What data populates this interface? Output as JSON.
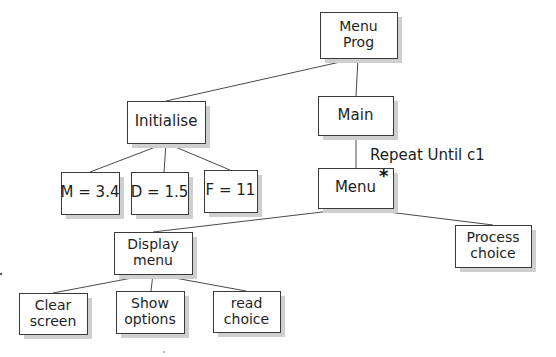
{
  "diagram": {
    "type": "structure-chart",
    "nodes": {
      "menu_prog": {
        "lines": [
          "Menu",
          "Prog"
        ],
        "x": 320,
        "y": 12,
        "w": 77,
        "h": 46
      },
      "initialise": {
        "lines": [
          "Initialise"
        ],
        "x": 127,
        "y": 101,
        "w": 78,
        "h": 42
      },
      "main": {
        "lines": [
          "Main"
        ],
        "x": 318,
        "y": 96,
        "w": 75,
        "h": 39
      },
      "m": {
        "lines": [
          "M = 3.4"
        ],
        "x": 61,
        "y": 172,
        "w": 58,
        "h": 42
      },
      "d": {
        "lines": [
          "D = 1.5"
        ],
        "x": 131,
        "y": 172,
        "w": 57,
        "h": 42
      },
      "f": {
        "lines": [
          "F = 11"
        ],
        "x": 204,
        "y": 170,
        "w": 53,
        "h": 42
      },
      "menu": {
        "lines": [
          "Menu"
        ],
        "x": 318,
        "y": 168,
        "w": 75,
        "h": 40,
        "iteration_marker": "*"
      },
      "display_menu": {
        "lines": [
          "Display",
          "menu"
        ],
        "x": 114,
        "y": 232,
        "w": 78,
        "h": 42
      },
      "process_choice": {
        "lines": [
          "Process",
          "choice"
        ],
        "x": 455,
        "y": 225,
        "w": 76,
        "h": 42
      },
      "clear_screen": {
        "lines": [
          "Clear",
          "screen"
        ],
        "x": 19,
        "y": 293,
        "w": 68,
        "h": 41
      },
      "show_options": {
        "lines": [
          "Show",
          "options"
        ],
        "x": 116,
        "y": 291,
        "w": 68,
        "h": 42
      },
      "read_choice": {
        "lines": [
          "read",
          "choice"
        ],
        "x": 213,
        "y": 291,
        "w": 67,
        "h": 41
      }
    },
    "edges": [
      {
        "from": "menu_prog",
        "to": "initialise"
      },
      {
        "from": "menu_prog",
        "to": "main"
      },
      {
        "from": "initialise",
        "to": "m"
      },
      {
        "from": "initialise",
        "to": "d"
      },
      {
        "from": "initialise",
        "to": "f"
      },
      {
        "from": "main",
        "to": "menu",
        "label": "Repeat Until c1"
      },
      {
        "from": "menu",
        "to": "display_menu"
      },
      {
        "from": "menu",
        "to": "process_choice"
      },
      {
        "from": "display_menu",
        "to": "clear_screen"
      },
      {
        "from": "display_menu",
        "to": "show_options"
      },
      {
        "from": "display_menu",
        "to": "read_choice"
      }
    ],
    "annotations": {
      "repeat_condition": "Repeat Until c1",
      "iteration_star": "*"
    },
    "colors": {
      "box_border": "#3a3a3a",
      "box_shadow": "#cfcfcf",
      "edge": "#4a4a4a",
      "text": "#1e1e1e",
      "background": "#ffffff"
    }
  }
}
